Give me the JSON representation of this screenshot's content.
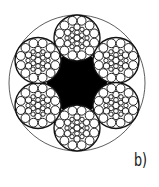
{
  "figure": {
    "label": "b)",
    "strand_count": 6,
    "core": "solid black six-point star fiber core",
    "colors": {
      "stroke": "#333333",
      "core": "#000000",
      "background": "#ffffff"
    }
  }
}
